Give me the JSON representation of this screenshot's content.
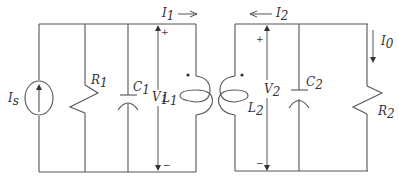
{
  "diagram": {
    "type": "coupled-inductor parallel RLC circuit",
    "line_color": "#555555",
    "labels": {
      "source": {
        "main": "I",
        "sub": "s"
      },
      "r1": {
        "main": "R",
        "sub": "1"
      },
      "c1": {
        "main": "C",
        "sub": "1"
      },
      "v1": {
        "main": "V",
        "sub": "1"
      },
      "l1": {
        "main": "L",
        "sub": "1"
      },
      "i1": {
        "main": "I",
        "sub": "1"
      },
      "i2": {
        "main": "I",
        "sub": "2"
      },
      "v2": {
        "main": "V",
        "sub": "2"
      },
      "l2": {
        "main": "L",
        "sub": "2"
      },
      "c2": {
        "main": "C",
        "sub": "2"
      },
      "r2": {
        "main": "R",
        "sub": "2"
      },
      "i0": {
        "main": "I",
        "sub": "0"
      }
    },
    "polarity": {
      "v1_plus": "+",
      "v1_minus": "−",
      "v2_plus": "+",
      "v2_minus": "−"
    },
    "components": [
      {
        "id": "Is",
        "kind": "current-source",
        "direction": "up"
      },
      {
        "id": "R1",
        "kind": "resistor"
      },
      {
        "id": "C1",
        "kind": "capacitor"
      },
      {
        "id": "V1",
        "kind": "voltage-arrow"
      },
      {
        "id": "L1",
        "kind": "coupled-inductor",
        "dot": "top"
      },
      {
        "id": "L2",
        "kind": "coupled-inductor",
        "dot": "top"
      },
      {
        "id": "V2",
        "kind": "voltage-arrow"
      },
      {
        "id": "C2",
        "kind": "capacitor"
      },
      {
        "id": "R2",
        "kind": "resistor"
      }
    ],
    "currents": [
      {
        "id": "I1",
        "direction": "right"
      },
      {
        "id": "I2",
        "direction": "left"
      },
      {
        "id": "I0",
        "direction": "down"
      }
    ]
  }
}
